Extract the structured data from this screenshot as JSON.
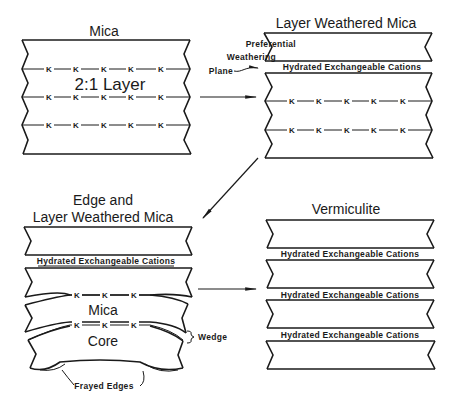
{
  "panels": {
    "mica": {
      "title": "Mica",
      "layer_label": "2:1 Layer",
      "k_row": [
        "K",
        "K",
        "K",
        "K",
        "K"
      ]
    },
    "layer_weathered": {
      "title": "Layer Weathered Mica",
      "pref_line1": "Preferential",
      "pref_line2": "Weathering",
      "pref_line3": "Plane",
      "hec": "Hydrated Exchangeable Cations",
      "k_row": [
        "K",
        "K",
        "K",
        "K",
        "K"
      ]
    },
    "edge_layer_weathered": {
      "title_line1": "Edge and",
      "title_line2": "Layer Weathered Mica",
      "hec": "Hydrated Exchangeable Cations",
      "k_row": [
        "K",
        "K",
        "K"
      ],
      "mica_label": "Mica",
      "core_label": "Core",
      "wedge_label": "Wedge",
      "frayed_label": "Frayed Edges"
    },
    "vermiculite": {
      "title": "Vermiculite",
      "hec": [
        "Hydrated Exchangeable Cations",
        "Hydrated Exchangeable Cations",
        "Hydrated Exchangeable Cations"
      ]
    }
  },
  "colors": {
    "ink": "#1a1a1a",
    "background": "#ffffff"
  }
}
